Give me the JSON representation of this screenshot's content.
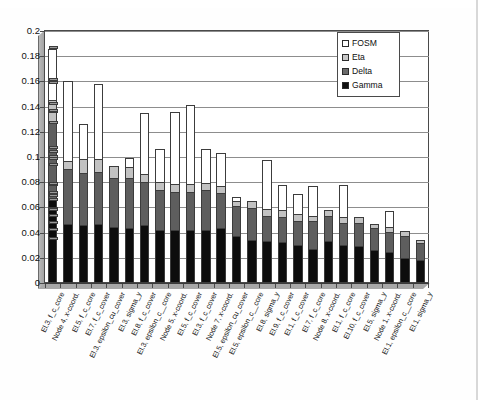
{
  "chart_data": {
    "type": "bar",
    "subtype": "stacked-column",
    "title": "",
    "xlabel": "",
    "ylabel": "",
    "ylim": [
      0,
      0.2
    ],
    "ytick_values": [
      0,
      0.02,
      0.04,
      0.06,
      0.08,
      0.1,
      0.12,
      0.14,
      0.16,
      0.18,
      0.2
    ],
    "ytick_labels": [
      "0",
      "0.02",
      "0.04",
      "0.06",
      "0.08",
      "0.1",
      "0.12",
      "0.14",
      "0.16",
      "0.18",
      "0.2"
    ],
    "grid": true,
    "legend_position": "top-right",
    "categories": [
      "El.3, f_c_core",
      "Node 4, x-coord.",
      "El.5, f_c_core",
      "El.7, f_c_cover",
      "El.3, epsilon_cu_cover",
      "El.3, sigma_y",
      "El.8, f_c_cover",
      "El.3, epsilon_c__core",
      "Node 5, x-coord.",
      "El.5, f_c_cover",
      "El.3, f_c_cover",
      "Node 7, x-coord.",
      "El.5, epsilon_cu_cover",
      "El.5, epsilon_c__core",
      "El.8, sigma_y",
      "El.9, f_c_cover",
      "El.1, f_c_cover",
      "El.7, f_c_core",
      "Node 8, x-coord.",
      "El.1, f_c_core",
      "El.10, f_c_cover",
      "El.5, sigma_y",
      "Node 1, x-coord.",
      "El.1, epsilon_c__core",
      "El.1, sigma_y"
    ],
    "series": [
      {
        "name": "Gamma",
        "color": "#0d0d0d",
        "values": [
          0.067,
          0.046,
          0.046,
          0.046,
          0.044,
          0.044,
          0.046,
          0.042,
          0.042,
          0.042,
          0.042,
          0.044,
          0.038,
          0.034,
          0.033,
          0.033,
          0.03,
          0.027,
          0.034,
          0.03,
          0.03,
          0.026,
          0.025,
          0.02,
          0.018
        ]
      },
      {
        "name": "Delta",
        "color": "#5e5e5e",
        "values": [
          0.06,
          0.044,
          0.042,
          0.042,
          0.04,
          0.04,
          0.034,
          0.032,
          0.03,
          0.03,
          0.032,
          0.028,
          0.024,
          0.026,
          0.02,
          0.02,
          0.02,
          0.022,
          0.02,
          0.018,
          0.018,
          0.018,
          0.016,
          0.018,
          0.014
        ]
      },
      {
        "name": "Eta",
        "color": "#c2c2c2",
        "values": [
          0.018,
          0.006,
          0.01,
          0.01,
          0.009,
          0.009,
          0.006,
          0.006,
          0.006,
          0.006,
          0.005,
          0.005,
          0.004,
          0.005,
          0.005,
          0.005,
          0.005,
          0.004,
          0.004,
          0.004,
          0.004,
          0.003,
          0.003,
          0.003,
          0.002
        ]
      },
      {
        "name": "FOSM",
        "color": "#ffffff",
        "values": [
          0.041,
          0.064,
          0.028,
          0.06,
          0.0,
          0.006,
          0.049,
          0.026,
          0.058,
          0.063,
          0.027,
          0.026,
          0.002,
          0.0,
          0.04,
          0.02,
          0.016,
          0.024,
          0.0,
          0.026,
          0.0,
          0.0,
          0.013,
          0.0,
          0.0
        ]
      }
    ],
    "totals": [
      0.186,
      0.16,
      0.126,
      0.158,
      0.093,
      0.099,
      0.135,
      0.106,
      0.136,
      0.141,
      0.106,
      0.103,
      0.068,
      0.065,
      0.098,
      0.078,
      0.071,
      0.077,
      0.058,
      0.078,
      0.052,
      0.047,
      0.057,
      0.041,
      0.034
    ]
  },
  "legend": {
    "items": [
      {
        "label": "FOSM",
        "swatch": "fosm"
      },
      {
        "label": "Eta",
        "swatch": "eta"
      },
      {
        "label": "Delta",
        "swatch": "delta"
      },
      {
        "label": "Gamma",
        "swatch": "gamma"
      }
    ]
  }
}
